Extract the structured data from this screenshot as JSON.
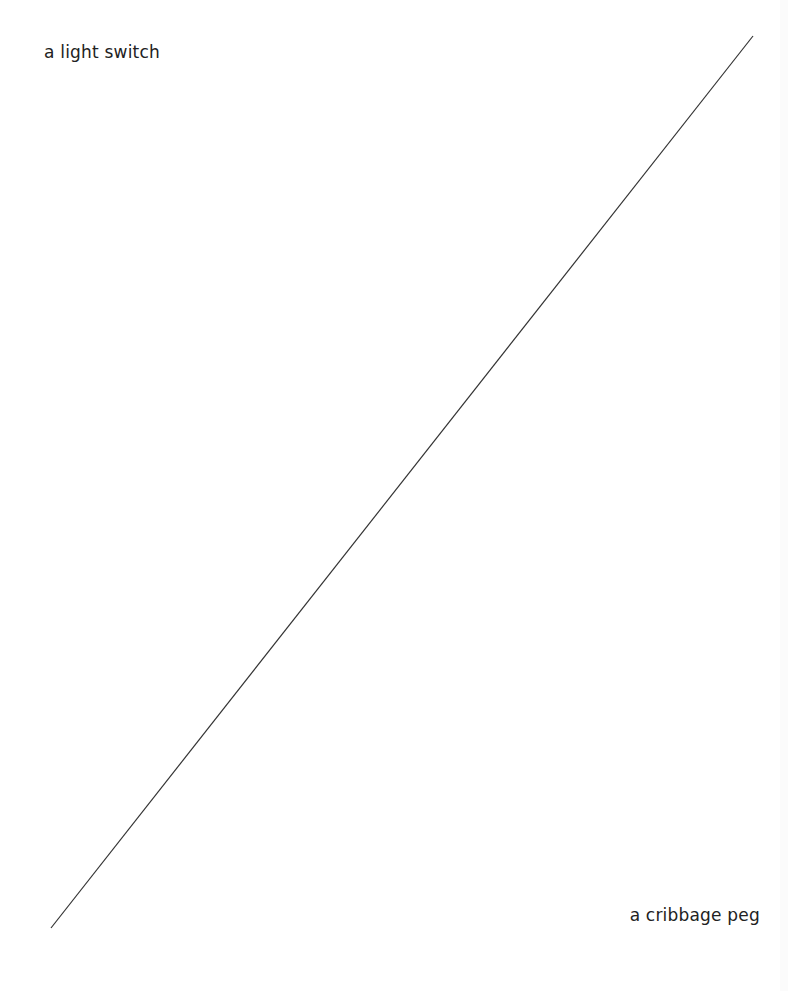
{
  "diagram": {
    "type": "axis-line",
    "top_left_label": "a light switch",
    "bottom_right_label": "a cribbage peg",
    "line": {
      "x1": 51,
      "y1": 928,
      "x2": 753,
      "y2": 36,
      "color": "#333333"
    }
  }
}
